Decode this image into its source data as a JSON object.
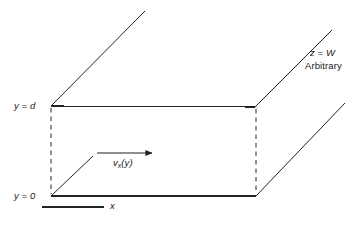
{
  "figure": {
    "type": "diagram",
    "background_color": "#ffffff",
    "line_color": "#222222",
    "text_color": "#1a1a1a",
    "width": 362,
    "height": 225,
    "labels": {
      "y_top": "y = d",
      "y_bottom": "y = 0",
      "z_depth": "z = W",
      "z_note": "Arbitrary",
      "velocity": "v",
      "velocity_subscript": "x",
      "velocity_arg": "(y)",
      "x_axis": "x"
    },
    "geometry": {
      "front_face": {
        "top_left": [
          51,
          106
        ],
        "top_right": [
          255,
          107
        ],
        "bottom_right": [
          256,
          196
        ],
        "bottom_left": [
          51,
          196
        ],
        "edges": {
          "top": "solid",
          "bottom": "solid",
          "left": "dashed",
          "right": "dashed"
        }
      },
      "depth_direction": "up-and-right",
      "depth_lines": [
        {
          "from": [
            51,
            106
          ],
          "to": [
            145,
            11
          ],
          "style": "solid"
        },
        {
          "from": [
            255,
            107
          ],
          "to": [
            332,
            30
          ],
          "style": "solid"
        },
        {
          "from": [
            256,
            196
          ],
          "to": [
            345,
            103
          ],
          "style": "solid"
        },
        {
          "from": [
            51,
            196
          ],
          "to": [
            93,
            156
          ],
          "style": "solid"
        }
      ],
      "velocity_arrow": {
        "from": [
          97,
          153
        ],
        "to": [
          154,
          153
        ]
      },
      "x_axis_line": {
        "from": [
          42,
          207
        ],
        "to": [
          104,
          207
        ]
      }
    }
  }
}
